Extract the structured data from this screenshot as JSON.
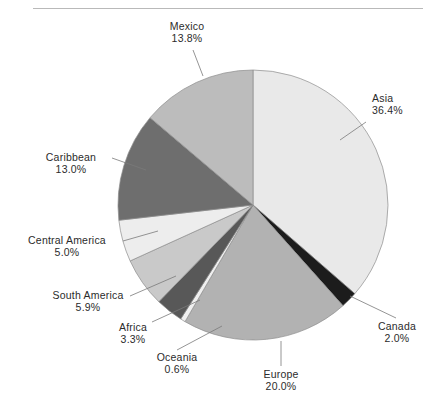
{
  "chart_data": {
    "type": "pie",
    "title": "",
    "subtitle": "",
    "xlabel": "",
    "ylabel": "",
    "legend": "none",
    "grid": false,
    "units": "percent",
    "start_angle_deg": 0,
    "direction": "clockwise",
    "center": {
      "x": 253,
      "y": 205
    },
    "radius": 135,
    "categories": [
      "Asia",
      "Canada",
      "Europe",
      "Oceania",
      "Africa",
      "South America",
      "Central America",
      "Caribbean",
      "Mexico"
    ],
    "values": [
      36.4,
      2.0,
      20.0,
      0.6,
      3.3,
      5.9,
      5.0,
      13.0,
      13.8
    ],
    "slices": [
      {
        "name": "Asia",
        "value": 36.4,
        "value_label": "36.4%",
        "color": "#e9e9e9",
        "start_deg": 0.0,
        "end_deg": 131.04,
        "label_position": "right",
        "label_align": "left",
        "label_x": 372,
        "label_y": 98,
        "leader_from": {
          "x": 366,
          "y": 122
        },
        "leader_to": {
          "x": 340,
          "y": 140
        }
      },
      {
        "name": "Canada",
        "value": 2.0,
        "value_label": "2.0%",
        "color": "#1c1c1c",
        "start_deg": 131.04,
        "end_deg": 138.24,
        "label_position": "bottom-right",
        "label_align": "center",
        "label_x": 396,
        "label_y": 323,
        "leader_from": {
          "x": 396,
          "y": 318
        },
        "leader_to": {
          "x": 350,
          "y": 296
        }
      },
      {
        "name": "Europe",
        "value": 20.0,
        "value_label": "20.0%",
        "color": "#b2b2b2",
        "start_deg": 138.24,
        "end_deg": 210.24,
        "label_position": "bottom",
        "label_align": "center",
        "label_x": 281,
        "label_y": 371,
        "leader_from": {
          "x": 281,
          "y": 366
        },
        "leader_to": {
          "x": 281,
          "y": 341
        }
      },
      {
        "name": "Oceania",
        "value": 0.6,
        "value_label": "0.6%",
        "color": "#efefef",
        "start_deg": 210.24,
        "end_deg": 212.4,
        "label_position": "bottom-left",
        "label_align": "center",
        "label_x": 177,
        "label_y": 355,
        "leader_from": {
          "x": 177,
          "y": 350
        },
        "leader_to": {
          "x": 222,
          "y": 326
        }
      },
      {
        "name": "Africa",
        "value": 3.3,
        "value_label": "3.3%",
        "color": "#585858",
        "start_deg": 212.4,
        "end_deg": 224.28,
        "label_position": "bottom-left",
        "label_align": "center",
        "label_x": 133,
        "label_y": 325,
        "leader_from": {
          "x": 152,
          "y": 322
        },
        "leader_to": {
          "x": 200,
          "y": 300
        }
      },
      {
        "name": "South America",
        "value": 5.9,
        "value_label": "5.9%",
        "color": "#c9c9c9",
        "start_deg": 224.28,
        "end_deg": 245.52,
        "label_position": "left",
        "label_align": "center",
        "label_x": 88,
        "label_y": 293,
        "leader_from": {
          "x": 130,
          "y": 296
        },
        "leader_to": {
          "x": 176,
          "y": 276
        }
      },
      {
        "name": "Central America",
        "value": 5.0,
        "value_label": "5.0%",
        "color": "#ededed",
        "start_deg": 245.52,
        "end_deg": 263.52,
        "label_position": "left",
        "label_align": "center",
        "label_x": 67,
        "label_y": 238,
        "leader_from": {
          "x": 123,
          "y": 241
        },
        "leader_to": {
          "x": 158,
          "y": 231
        }
      },
      {
        "name": "Caribbean",
        "value": 13.0,
        "value_label": "13.0%",
        "color": "#6e6e6e",
        "start_deg": 263.52,
        "end_deg": 310.32,
        "label_position": "left",
        "label_align": "center",
        "label_x": 72,
        "label_y": 155,
        "leader_from": {
          "x": 112,
          "y": 158
        },
        "leader_to": {
          "x": 146,
          "y": 170
        }
      },
      {
        "name": "Mexico",
        "value": 13.8,
        "value_label": "13.8%",
        "color": "#bcbcbc",
        "start_deg": 310.32,
        "end_deg": 360.0,
        "label_position": "top",
        "label_align": "center",
        "label_x": 186,
        "label_y": 24,
        "leader_from": {
          "x": 193,
          "y": 50
        },
        "leader_to": {
          "x": 203,
          "y": 76
        }
      }
    ]
  },
  "labels": {
    "asia": {
      "name": "Asia",
      "pct": "36.4%"
    },
    "canada": {
      "name": "Canada",
      "pct": "2.0%"
    },
    "europe": {
      "name": "Europe",
      "pct": "20.0%"
    },
    "oceania": {
      "name": "Oceania",
      "pct": "0.6%"
    },
    "africa": {
      "name": "Africa",
      "pct": "3.3%"
    },
    "south_america": {
      "name": "South America",
      "pct": "5.9%"
    },
    "central_america": {
      "name": "Central America",
      "pct": "5.0%"
    },
    "caribbean": {
      "name": "Caribbean",
      "pct": "13.0%"
    },
    "mexico": {
      "name": "Mexico",
      "pct": "13.8%"
    }
  },
  "caption": {
    "text": ""
  },
  "colors": {
    "page_background": "#ffffff",
    "rule": "#b9b9b9",
    "text": "#2b2b2b",
    "leader_line": "#7a7a7a",
    "pie_outline": "#8c8c8c"
  }
}
